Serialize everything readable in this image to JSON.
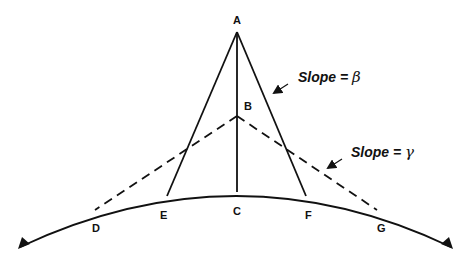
{
  "diagram": {
    "points": {
      "A": "A",
      "B": "B",
      "C": "C",
      "D": "D",
      "E": "E",
      "F": "F",
      "G": "G"
    },
    "annotations": {
      "slope_beta_prefix": "Slope = ",
      "slope_beta_symbol": "β",
      "slope_gamma_prefix": "Slope = ",
      "slope_gamma_symbol": "γ"
    },
    "colors": {
      "line": "#111111",
      "background": "#ffffff"
    }
  }
}
